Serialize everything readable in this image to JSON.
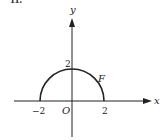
{
  "figure": {
    "problem_number": "11.",
    "axes": {
      "x_label": "x",
      "y_label": "y",
      "origin_label": "O"
    },
    "ticks": {
      "x_neg": "−2",
      "x_pos": "2",
      "y_pos": "2"
    },
    "curve": {
      "label": "F",
      "description": "upper semicircle of radius 2 centered at origin",
      "radius": 2
    },
    "colors": {
      "ink": "#222222",
      "background": "#ffffff"
    }
  }
}
